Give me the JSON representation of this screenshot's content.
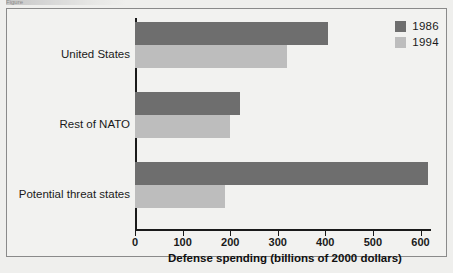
{
  "figure": {
    "cut_caption": "Figure",
    "legend_position": "top-right"
  },
  "chart_data": {
    "type": "bar",
    "orientation": "horizontal",
    "title": "",
    "subtitle": "",
    "categories": [
      "United States",
      "Rest of NATO",
      "Potential threat states"
    ],
    "series": [
      {
        "name": "1986",
        "color": "#6e6e6e",
        "values": [
          405,
          220,
          615
        ]
      },
      {
        "name": "1994",
        "color": "#bdbdbd",
        "values": [
          320,
          200,
          188
        ]
      }
    ],
    "xlabel": "Defense spending (billions of 2000 dollars)",
    "ylabel": "",
    "xlim": [
      0,
      620
    ],
    "xticks": [
      0,
      100,
      200,
      300,
      400,
      500,
      600
    ],
    "xtick_labels": [
      "0",
      "100",
      "200",
      "300",
      "400",
      "500",
      "600"
    ],
    "grid": false,
    "legend": [
      "1986",
      "1994"
    ]
  }
}
